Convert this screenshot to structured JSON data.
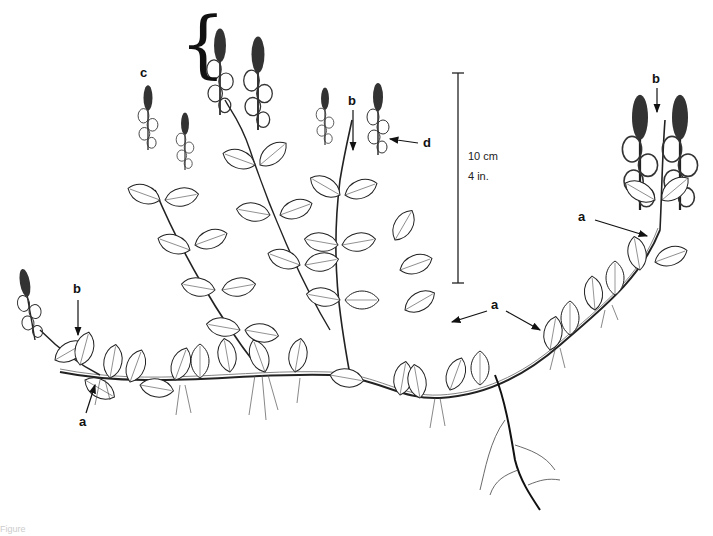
{
  "figure": {
    "caption_fragment": "Figure"
  },
  "scale_bar": {
    "metric": "10 cm",
    "imperial": "4 in."
  },
  "labels": {
    "a": "a",
    "b": "b",
    "c": "c",
    "d": "d"
  },
  "annotations": [
    {
      "label": "a",
      "x": 85,
      "y": 422,
      "target": "stolon node, left"
    },
    {
      "label": "a",
      "x": 493,
      "y": 306,
      "target": "leaves, center-right (two arrows)"
    },
    {
      "label": "a",
      "x": 580,
      "y": 218,
      "target": "stem base of right spike"
    },
    {
      "label": "b",
      "x": 76,
      "y": 288,
      "target": "leaf tip, left"
    },
    {
      "label": "b",
      "x": 352,
      "y": 130,
      "target": "leaf at spike base, center"
    },
    {
      "label": "b",
      "x": 656,
      "y": 78,
      "target": "leaf between right spikes"
    },
    {
      "label": "c",
      "x": 145,
      "y": 73,
      "target": "flowering spikes (brace)"
    },
    {
      "label": "d",
      "x": 424,
      "y": 143,
      "target": "single flower"
    }
  ],
  "colors": {
    "ink": "#111111",
    "background": "#ffffff"
  }
}
